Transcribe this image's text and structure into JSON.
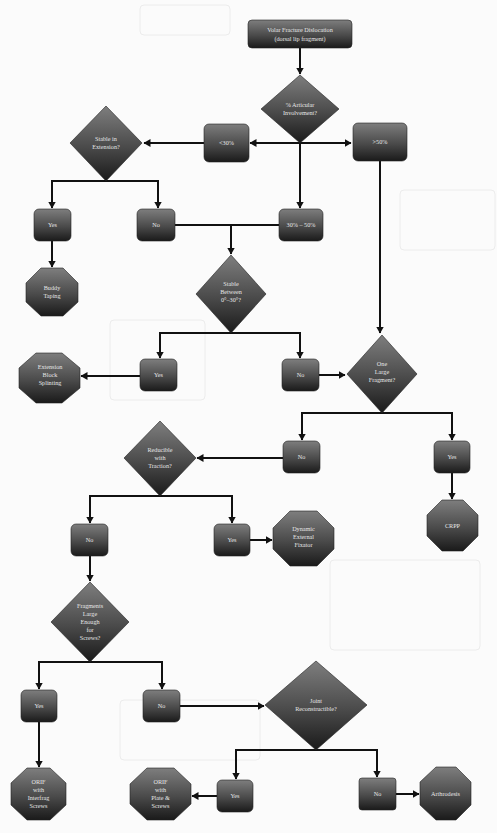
{
  "diagram": {
    "title": "Volar Fracture Dislocation (dorsal lip fragment)",
    "colors": {
      "background": "#fbfbfb",
      "shape_top": "#7a7a7a",
      "shape_bottom": "#1e1e1e",
      "text": "#e6e6e6",
      "line": "#111111"
    },
    "nodes": {
      "start": {
        "line1": "Volar Fracture Dislocation",
        "line2": "(dorsal lip fragment)"
      },
      "articular": {
        "line1": "% Articular",
        "line2": "Involvement?"
      },
      "lt30": {
        "label": "<30%"
      },
      "gt50": {
        "label": ">50%"
      },
      "mid": {
        "label": "30% – 50%"
      },
      "stable_ext": {
        "line1": "Stable in",
        "line2": "Extension?"
      },
      "stable_ext_yes": {
        "label": "Yes"
      },
      "stable_ext_no": {
        "label": "No"
      },
      "buddy": {
        "line1": "Buddy",
        "line2": "Taping"
      },
      "stable_between": {
        "line1": "Stable",
        "line2": "Between",
        "line3": "0°–30°?"
      },
      "ebs": {
        "line1": "Extension",
        "line2": "Block",
        "line3": "Splinting"
      },
      "sb_yes": {
        "label": "Yes"
      },
      "sb_no": {
        "label": "No"
      },
      "one_large": {
        "line1": "One",
        "line2": "Large",
        "line3": "Fragment?"
      },
      "ol_no": {
        "label": "No"
      },
      "ol_yes": {
        "label": "Yes"
      },
      "crpp": {
        "label": "CRPP"
      },
      "reducible": {
        "line1": "Reducible",
        "line2": "with",
        "line3": "Traction?"
      },
      "red_no": {
        "label": "No"
      },
      "red_yes": {
        "label": "Yes"
      },
      "dyn_fix": {
        "line1": "Dynamic",
        "line2": "External",
        "line3": "Fixator"
      },
      "frag_large": {
        "line1": "Fragments",
        "line2": "Large",
        "line3": "Enough",
        "line4": "for",
        "line5": "Screws?"
      },
      "fl_yes": {
        "label": "Yes"
      },
      "fl_no": {
        "label": "No"
      },
      "joint": {
        "line1": "Joint",
        "line2": "Reconstructible?"
      },
      "jr_yes": {
        "label": "Yes"
      },
      "jr_no": {
        "label": "No"
      },
      "arthrodesis": {
        "label": "Arthrodesis"
      },
      "orif_interfrag": {
        "line1": "ORIF",
        "line2": "with",
        "line3": "Interfrag",
        "line4": "Screws"
      },
      "orif_plate": {
        "line1": "ORIF",
        "line2": "with",
        "line3": "Plate &",
        "line4": "Screws"
      }
    }
  }
}
